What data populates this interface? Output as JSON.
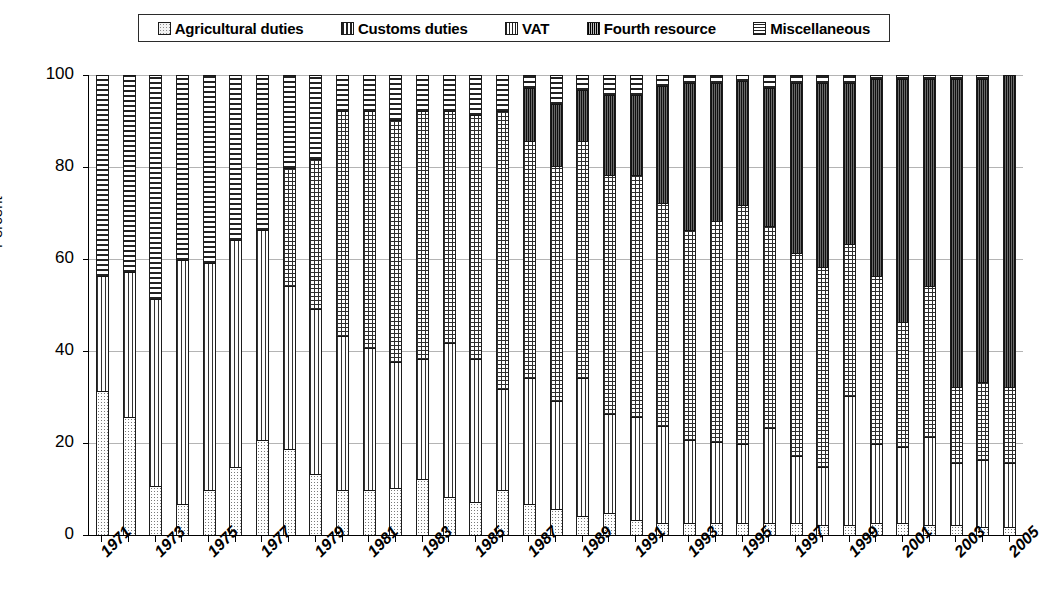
{
  "legend": {
    "items": [
      {
        "label": "Agricultural duties",
        "swatch": "agri-swatch-icon",
        "pattern": "light-dotted"
      },
      {
        "label": "Customs duties",
        "swatch": "customs-swatch-icon",
        "pattern": "vertical-stripes"
      },
      {
        "label": "VAT",
        "swatch": "vat-swatch-icon",
        "pattern": "grid-crosshatch"
      },
      {
        "label": "Fourth resource",
        "swatch": "fourth-resource-swatch-icon",
        "pattern": "dark-vertical-stripes"
      },
      {
        "label": "Miscellaneous",
        "swatch": "miscellaneous-swatch-icon",
        "pattern": "horizontal-stripes"
      }
    ]
  },
  "axes": {
    "y_title": "Percent",
    "y_ticks": [
      "0",
      "20",
      "40",
      "60",
      "80",
      "100"
    ],
    "x_tick_labels": [
      "1971",
      "1973",
      "1975",
      "1977",
      "1979",
      "1981",
      "1983",
      "1985",
      "1987",
      "1989",
      "1991",
      "1993",
      "1995",
      "1997",
      "1999",
      "2001",
      "2003",
      "2005"
    ]
  },
  "chart_data": {
    "type": "bar",
    "subtype": "stacked-100-percent",
    "title": "",
    "xlabel": "",
    "ylabel": "Percent",
    "ylim": [
      0,
      100
    ],
    "grid": true,
    "legend_position": "top",
    "categories": [
      "1971",
      "1972",
      "1973",
      "1974",
      "1975",
      "1976",
      "1977",
      "1978",
      "1979",
      "1980",
      "1981",
      "1982",
      "1983",
      "1984",
      "1985",
      "1986",
      "1987",
      "1988",
      "1989",
      "1990",
      "1991",
      "1992",
      "1993",
      "1994",
      "1995",
      "1996",
      "1997",
      "1998",
      "1999",
      "2000",
      "2001",
      "2002",
      "2003",
      "2004",
      "2005"
    ],
    "series": [
      {
        "name": "Agricultural duties",
        "pattern": "light-dotted",
        "values": [
          31,
          25.5,
          10.5,
          6.5,
          9.5,
          14.5,
          20.5,
          18.5,
          13,
          9.5,
          9.5,
          10,
          12,
          8,
          7,
          9.5,
          6.5,
          5.5,
          4,
          4.5,
          3,
          2.5,
          2.5,
          2.5,
          2.5,
          2.5,
          2.5,
          2,
          2,
          2.5,
          2.5,
          2,
          2,
          1.5,
          1.5
        ]
      },
      {
        "name": "Customs duties",
        "pattern": "vertical-stripes",
        "values": [
          25,
          31.5,
          40.5,
          53,
          49.5,
          49.5,
          45.5,
          35.5,
          36,
          33.5,
          31,
          27.5,
          26,
          33.5,
          31,
          22,
          27.5,
          23.5,
          30,
          21.5,
          22.5,
          21,
          18,
          17.5,
          17,
          20.5,
          14.5,
          12.5,
          28,
          17,
          16.5,
          19,
          13.5,
          14.5,
          14
        ]
      },
      {
        "name": "VAT",
        "pattern": "grid-crosshatch",
        "values": [
          0,
          0,
          0,
          0,
          0,
          0,
          0,
          25.5,
          32.5,
          49,
          51.5,
          52.5,
          54,
          50.5,
          53,
          60.5,
          51.5,
          51,
          51.5,
          52,
          52.5,
          48.5,
          45.5,
          48,
          52,
          44,
          44,
          43.5,
          33,
          36.5,
          27,
          33,
          16.5,
          17,
          16.5
        ]
      },
      {
        "name": "Fourth resource",
        "pattern": "dark-vertical-stripes",
        "values": [
          0,
          0,
          0,
          0,
          0,
          0,
          0,
          0,
          0,
          0,
          0,
          0,
          0,
          0,
          0,
          0,
          11.5,
          13.5,
          11,
          17.5,
          17.5,
          25.5,
          32,
          30,
          27,
          30,
          37,
          40,
          35,
          43,
          53,
          45,
          67,
          66,
          68
        ]
      },
      {
        "name": "Miscellaneous",
        "pattern": "horizontal-stripes",
        "values": [
          44,
          43,
          49,
          40.5,
          41,
          36,
          34,
          20.5,
          18.5,
          8,
          8,
          10,
          8,
          8,
          9,
          8,
          3,
          6.5,
          3.5,
          4.5,
          4.5,
          2.5,
          2,
          2,
          1.5,
          3,
          2,
          2,
          2,
          1,
          1,
          1,
          1,
          1,
          0
        ]
      }
    ]
  },
  "colors": {
    "grid": "#b4b4b4",
    "axis": "#000000",
    "background": "#ffffff",
    "fourth_resource_fill": "#4a4a4a"
  }
}
